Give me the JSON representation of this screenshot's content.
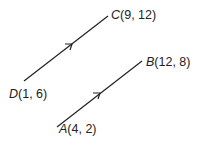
{
  "diagram": {
    "type": "vectors",
    "points": {
      "A": {
        "letter": "A",
        "coords": "(4, 2)"
      },
      "B": {
        "letter": "B",
        "coords": "(12, 8)"
      },
      "C": {
        "letter": "C",
        "coords": "(9, 12)"
      },
      "D": {
        "letter": "D",
        "coords": "(1, 6)"
      }
    },
    "segments": [
      {
        "from": "D",
        "to": "C",
        "arrow": "midpoint"
      },
      {
        "from": "A",
        "to": "B",
        "arrow": "midpoint"
      }
    ],
    "colors": {
      "line": "#222222",
      "text": "#222222"
    }
  }
}
